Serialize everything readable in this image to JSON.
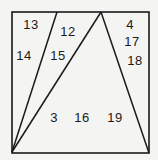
{
  "diagram": {
    "stroke_color": "#1a1a1a",
    "background": "#f4f4f2",
    "frame": {
      "x1": 12,
      "y1": 12,
      "x2": 149,
      "y2": 153
    },
    "lines": [
      {
        "name": "left-diagonal",
        "x1": 12,
        "y1": 152,
        "x2": 57,
        "y2": 12
      },
      {
        "name": "middle-diagonal",
        "x1": 12,
        "y1": 152,
        "x2": 101,
        "y2": 12
      },
      {
        "name": "right-diagonal",
        "x1": 101,
        "y1": 12,
        "x2": 149,
        "y2": 153
      }
    ],
    "labels": [
      {
        "text": "13",
        "x": 31,
        "y": 24
      },
      {
        "text": "14",
        "x": 24,
        "y": 55
      },
      {
        "text": "12",
        "x": 68,
        "y": 31
      },
      {
        "text": "15",
        "x": 58,
        "y": 55
      },
      {
        "text": "4",
        "x": 130,
        "y": 24
      },
      {
        "text": "17",
        "x": 132,
        "y": 41
      },
      {
        "text": "18",
        "x": 135,
        "y": 60
      },
      {
        "text": "3",
        "x": 54,
        "y": 117
      },
      {
        "text": "16",
        "x": 82,
        "y": 117
      },
      {
        "text": "19",
        "x": 115,
        "y": 117
      }
    ]
  }
}
